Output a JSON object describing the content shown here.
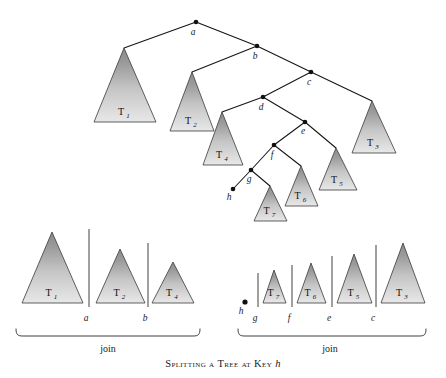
{
  "figure": {
    "caption_text": "Splitting a Tree at Key ",
    "caption_key": "h",
    "background": "#ffffff",
    "line_color": "#151515",
    "triangle_top_color": "#8d8d8d",
    "triangle_bottom_color": "#e6e6e6"
  },
  "tree": {
    "title": "binary search tree with subtrees",
    "nodes": [
      {
        "id": "a",
        "label": "a",
        "x": 196,
        "y": 22,
        "label_x": 193,
        "label_y": 35
      },
      {
        "id": "b",
        "label": "b",
        "x": 257,
        "y": 46,
        "label_x": 255,
        "label_y": 59
      },
      {
        "id": "c",
        "label": "c",
        "x": 311,
        "y": 72,
        "label_x": 309,
        "label_y": 85
      },
      {
        "id": "d",
        "label": "d",
        "x": 263,
        "y": 97,
        "label_x": 261,
        "label_y": 110
      },
      {
        "id": "e",
        "label": "e",
        "x": 305,
        "y": 122,
        "label_x": 303,
        "label_y": 134
      },
      {
        "id": "f",
        "label": "f",
        "x": 274,
        "y": 145,
        "label_x": 272,
        "label_y": 158
      },
      {
        "id": "g",
        "label": "g",
        "x": 251,
        "y": 170,
        "label_x": 249,
        "label_y": 182
      },
      {
        "id": "h",
        "label": "h",
        "x": 233,
        "y": 189,
        "label_x": 229,
        "label_y": 200
      }
    ],
    "edges": [
      {
        "from": "a",
        "to": "T1"
      },
      {
        "from": "a",
        "to": "b"
      },
      {
        "from": "b",
        "to": "T2"
      },
      {
        "from": "b",
        "to": "c"
      },
      {
        "from": "c",
        "to": "d"
      },
      {
        "from": "c",
        "to": "T3"
      },
      {
        "from": "d",
        "to": "T4"
      },
      {
        "from": "d",
        "to": "e"
      },
      {
        "from": "e",
        "to": "f"
      },
      {
        "from": "e",
        "to": "T5"
      },
      {
        "from": "f",
        "to": "g"
      },
      {
        "from": "f",
        "to": "T6"
      },
      {
        "from": "g",
        "to": "h"
      },
      {
        "from": "g",
        "to": "T7"
      }
    ],
    "subtrees": [
      {
        "id": "T1",
        "label": "T",
        "sub": "1",
        "apex_x": 124,
        "apex_y": 48,
        "left_x": 94,
        "right_x": 156,
        "base_y": 122
      },
      {
        "id": "T2",
        "label": "T",
        "sub": "2",
        "apex_x": 192,
        "apex_y": 72,
        "left_x": 170,
        "right_x": 214,
        "base_y": 131
      },
      {
        "id": "T3",
        "label": "T",
        "sub": "3",
        "apex_x": 372,
        "apex_y": 101,
        "left_x": 352,
        "right_x": 396,
        "base_y": 153
      },
      {
        "id": "T4",
        "label": "T",
        "sub": "4",
        "apex_x": 222,
        "apex_y": 112,
        "left_x": 203,
        "right_x": 243,
        "base_y": 165
      },
      {
        "id": "T5",
        "label": "T",
        "sub": "5",
        "apex_x": 336,
        "apex_y": 148,
        "left_x": 319,
        "right_x": 357,
        "base_y": 190
      },
      {
        "id": "T6",
        "label": "T",
        "sub": "6",
        "apex_x": 301,
        "apex_y": 166,
        "left_x": 285,
        "right_x": 318,
        "base_y": 206
      },
      {
        "id": "T7",
        "label": "T",
        "sub": "7",
        "apex_x": 270,
        "apex_y": 186,
        "left_x": 254,
        "right_x": 287,
        "base_y": 221
      }
    ]
  },
  "split_result": {
    "baseline_y": 303,
    "left_group": {
      "join_label": "join",
      "join_label_x": 108,
      "join_label_y": 352,
      "brace_left_x": 16,
      "brace_right_x": 200,
      "brace_y": 336,
      "subtrees": [
        {
          "id": "T1",
          "label": "T",
          "sub": "1",
          "apex_x": 52,
          "apex_y": 232,
          "left_x": 22,
          "right_x": 83
        },
        {
          "id": "T2",
          "label": "T",
          "sub": "2",
          "apex_x": 120,
          "apex_y": 249,
          "left_x": 96,
          "right_x": 145
        },
        {
          "id": "T4",
          "label": "T",
          "sub": "4",
          "apex_x": 173,
          "apex_y": 262,
          "left_x": 152,
          "right_x": 194
        }
      ],
      "dividers": [
        {
          "key": "a",
          "x": 89,
          "top_y": 229,
          "bottom_y": 307,
          "label_x": 86,
          "label_y": 321
        },
        {
          "key": "b",
          "x": 148,
          "top_y": 243,
          "bottom_y": 307,
          "label_x": 145,
          "label_y": 321
        }
      ]
    },
    "right_group": {
      "join_label": "join",
      "join_label_x": 330,
      "join_label_y": 352,
      "brace_left_x": 238,
      "brace_right_x": 426,
      "brace_y": 336,
      "h_node": {
        "label": "h",
        "x": 245,
        "y": 302,
        "label_x": 241,
        "label_y": 314
      },
      "subtrees": [
        {
          "id": "T7",
          "label": "T",
          "sub": "7",
          "apex_x": 274,
          "apex_y": 270,
          "left_x": 263,
          "right_x": 286
        },
        {
          "id": "T6",
          "label": "T",
          "sub": "6",
          "apex_x": 311,
          "apex_y": 263,
          "left_x": 297,
          "right_x": 326
        },
        {
          "id": "T5",
          "label": "T",
          "sub": "5",
          "apex_x": 354,
          "apex_y": 254,
          "left_x": 337,
          "right_x": 372
        },
        {
          "id": "T3",
          "label": "T",
          "sub": "3",
          "apex_x": 403,
          "apex_y": 243,
          "left_x": 381,
          "right_x": 425
        }
      ],
      "dividers": [
        {
          "key": "g",
          "x": 258,
          "top_y": 273,
          "bottom_y": 307,
          "label_x": 255,
          "label_y": 321
        },
        {
          "key": "f",
          "x": 292,
          "top_y": 265,
          "bottom_y": 307,
          "label_x": 289,
          "label_y": 321
        },
        {
          "key": "e",
          "x": 332,
          "top_y": 256,
          "bottom_y": 307,
          "label_x": 329,
          "label_y": 321
        },
        {
          "key": "c",
          "x": 376,
          "top_y": 245,
          "bottom_y": 307,
          "label_x": 373,
          "label_y": 321
        }
      ]
    }
  }
}
